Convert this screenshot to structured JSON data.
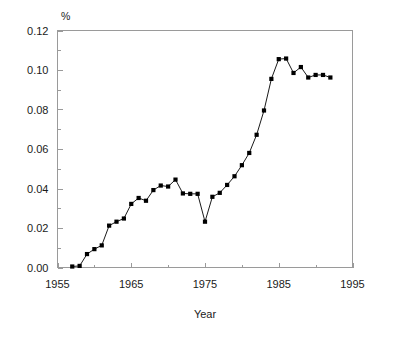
{
  "chart_data": {
    "type": "line",
    "title": "",
    "xlabel": "Year",
    "ylabel": "",
    "unit_label": "%",
    "xlim": [
      1955,
      1995
    ],
    "ylim": [
      0.0,
      0.12
    ],
    "grid": false,
    "legend": null,
    "x_ticks": [
      1955,
      1965,
      1975,
      1985,
      1995
    ],
    "x_tick_labels": [
      "1955",
      "1965",
      "1975",
      "1985",
      "1995"
    ],
    "x_minor_tick_interval": 5,
    "y_ticks": [
      0.0,
      0.02,
      0.04,
      0.06,
      0.08,
      0.1,
      0.12
    ],
    "y_tick_labels": [
      "0.00",
      "0.02",
      "0.04",
      "0.06",
      "0.08",
      "0.10",
      "0.12"
    ],
    "y_minor_tick_interval": 0.01,
    "marker": "square",
    "marker_color": "#000000",
    "line_color": "#000000",
    "axis_color": "#9a9a9a",
    "background_color": "#ffffff",
    "series": [
      {
        "name": "value",
        "x": [
          1957,
          1958,
          1959,
          1960,
          1961,
          1962,
          1963,
          1964,
          1965,
          1966,
          1967,
          1968,
          1969,
          1970,
          1971,
          1972,
          1973,
          1974,
          1975,
          1976,
          1977,
          1978,
          1979,
          1980,
          1981,
          1982,
          1983,
          1984,
          1985,
          1986,
          1987,
          1988,
          1989,
          1990,
          1991,
          1992
        ],
        "values": [
          0.0005,
          0.0008,
          0.0068,
          0.0093,
          0.0112,
          0.0212,
          0.0232,
          0.0248,
          0.0322,
          0.0352,
          0.0338,
          0.0392,
          0.0415,
          0.041,
          0.0445,
          0.0375,
          0.0373,
          0.0373,
          0.0232,
          0.0358,
          0.0378,
          0.0418,
          0.0462,
          0.0518,
          0.058,
          0.0672,
          0.0795,
          0.0955,
          0.1055,
          0.1058,
          0.0985,
          0.1015,
          0.0962,
          0.0975,
          0.0975,
          0.0962
        ]
      }
    ]
  }
}
